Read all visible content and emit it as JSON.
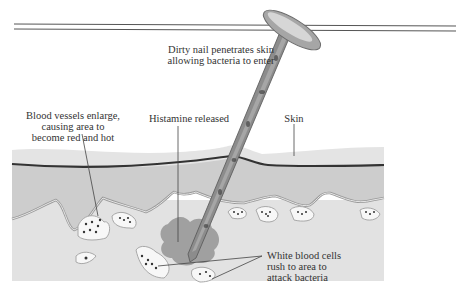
{
  "diagram": {
    "title_rules": {
      "count": 2,
      "color": "#555555"
    },
    "labels": {
      "nail": {
        "lines": [
          "Dirty nail penetrates skin",
          "allowing bacteria to enter"
        ]
      },
      "vessels": {
        "lines": [
          "Blood vessels enlarge,",
          "causing area to",
          "become red and hot"
        ]
      },
      "histamine": {
        "lines": [
          "Histamine released"
        ]
      },
      "skin": {
        "lines": [
          "Skin"
        ]
      },
      "wbc": {
        "lines": [
          "White blood cells",
          "rush to area to",
          "attack bacteria"
        ]
      }
    },
    "colors": {
      "epidermis": "#e4e4e4",
      "dermis": "#cfcfcf",
      "subcutis": "#e0e0e0",
      "skin_line": "#333333",
      "histamine": "#8a8a8a",
      "nail": "#8c8c8c",
      "vessel": "#f7f7f7",
      "leader": "#444444"
    }
  }
}
